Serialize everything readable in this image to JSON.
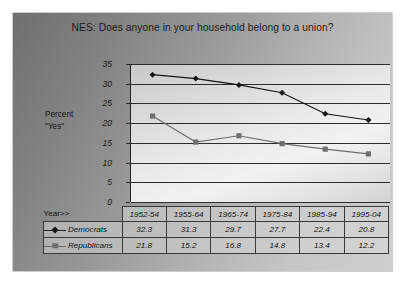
{
  "chart_title": "NES:  Does anyone in your household belong to a union?",
  "axis_label": {
    "line1": "Percent",
    "line2": "\"Yes\""
  },
  "table": {
    "corner_label": "Year>>",
    "democrats_label": "Democrats",
    "republicans_label": "Republicans"
  },
  "colors": {
    "democrats": "#141414",
    "republicans": "#6f6f6f",
    "panel_background": "#9a9a9a",
    "plot_background": "#e9e9e9",
    "gridline": "#2d2d2d",
    "axis": "#232323",
    "text": "#111111"
  },
  "chart_data": {
    "type": "line",
    "title": "NES:  Does anyone in your household belong to a union?",
    "xlabel": "Year>>",
    "ylabel": "Percent \"Yes\"",
    "ylim": [
      0,
      35
    ],
    "yticks": [
      0,
      5,
      10,
      15,
      20,
      25,
      30,
      35
    ],
    "ytick_labels": [
      "0",
      "5",
      "10",
      "15",
      "20",
      "25",
      "30",
      "35"
    ],
    "grid": "horizontal",
    "legend_position": "table-left",
    "categories": [
      "1952-54",
      "1955-64",
      "1965-74",
      "1975-84",
      "1985-94",
      "1995-04"
    ],
    "series": [
      {
        "name": "Democrats",
        "marker": "diamond",
        "color": "#141414",
        "values": [
          32.3,
          31.3,
          29.7,
          27.7,
          22.4,
          20.8
        ],
        "labels": [
          "32.3",
          "31.3",
          "29.7",
          "27.7",
          "22.4",
          "20.8"
        ]
      },
      {
        "name": "Republicans",
        "marker": "square",
        "color": "#6f6f6f",
        "values": [
          21.8,
          15.2,
          16.8,
          14.8,
          13.4,
          12.2
        ],
        "labels": [
          "21.8",
          "15.2",
          "16.8",
          "14.8",
          "13.4",
          "12.2"
        ]
      }
    ]
  }
}
